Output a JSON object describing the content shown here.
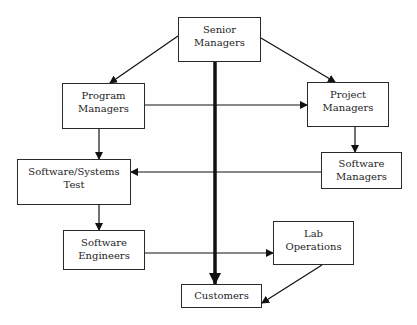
{
  "diagram": {
    "type": "organizational-flow",
    "nodes": [
      {
        "id": "senior_managers",
        "lines": [
          "Senior",
          "Managers"
        ]
      },
      {
        "id": "program_managers",
        "lines": [
          "Program",
          "Managers"
        ]
      },
      {
        "id": "project_managers",
        "lines": [
          "Project",
          "Managers"
        ]
      },
      {
        "id": "software_managers",
        "lines": [
          "Software",
          "Managers"
        ]
      },
      {
        "id": "software_systems_test",
        "lines": [
          "Software/Systems",
          "Test"
        ]
      },
      {
        "id": "software_engineers",
        "lines": [
          "Software",
          "Engineers"
        ]
      },
      {
        "id": "lab_operations",
        "lines": [
          "Lab",
          "Operations"
        ]
      },
      {
        "id": "customers",
        "lines": [
          "Customers"
        ]
      }
    ],
    "edges": [
      {
        "from": "senior_managers",
        "to": "program_managers",
        "style": "normal"
      },
      {
        "from": "senior_managers",
        "to": "project_managers",
        "style": "normal"
      },
      {
        "from": "senior_managers",
        "to": "customers",
        "style": "bold"
      },
      {
        "from": "program_managers",
        "to": "project_managers",
        "style": "normal"
      },
      {
        "from": "program_managers",
        "to": "software_systems_test",
        "style": "normal"
      },
      {
        "from": "project_managers",
        "to": "software_managers",
        "style": "normal"
      },
      {
        "from": "software_managers",
        "to": "software_systems_test",
        "style": "normal"
      },
      {
        "from": "software_systems_test",
        "to": "software_engineers",
        "style": "normal"
      },
      {
        "from": "software_engineers",
        "to": "lab_operations",
        "style": "normal"
      },
      {
        "from": "lab_operations",
        "to": "customers",
        "style": "normal"
      }
    ]
  }
}
